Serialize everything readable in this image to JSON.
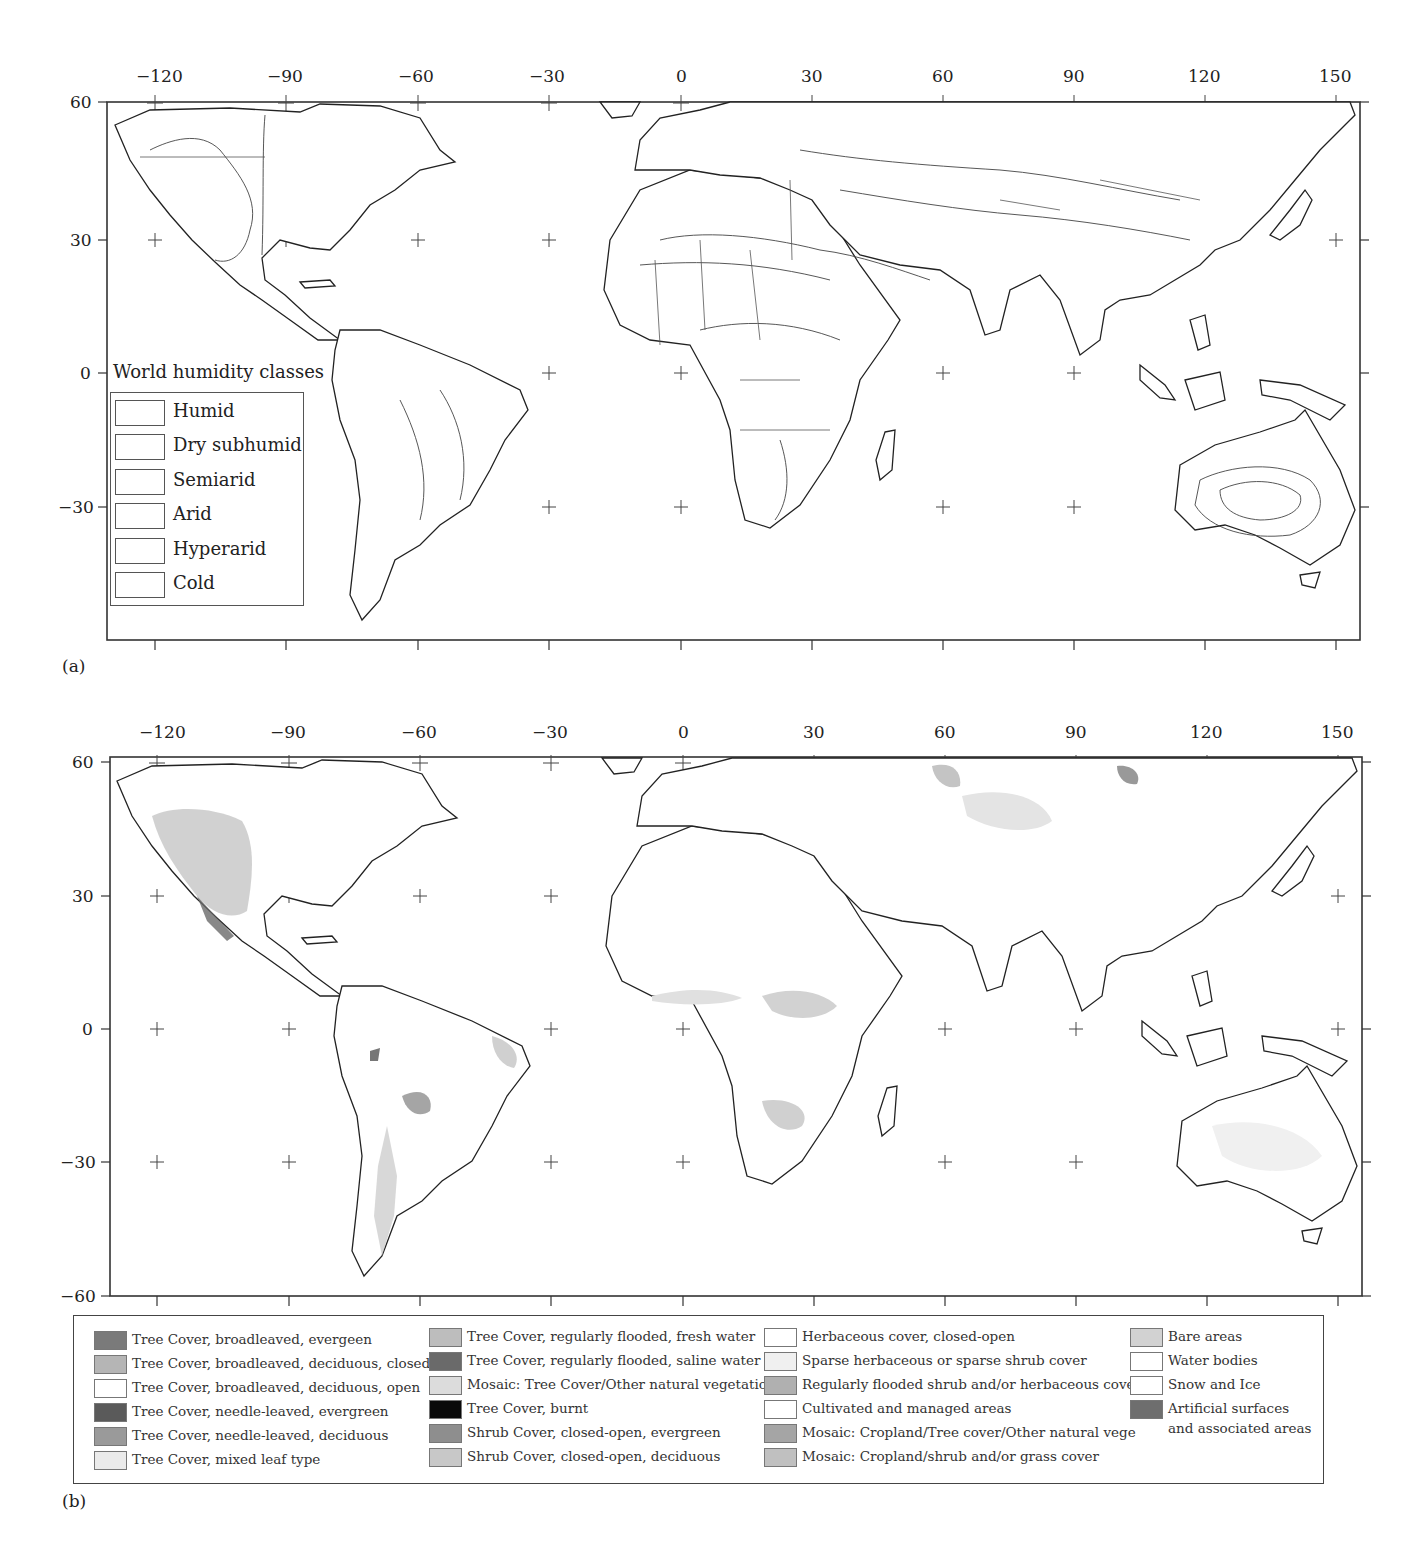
{
  "figure": {
    "panels": [
      {
        "label": "(a)",
        "legend": {
          "title": "World humidity classes",
          "items": [
            "Humid",
            "Dry subhumid",
            "Semiarid",
            "Arid",
            "Hyperarid",
            "Cold"
          ]
        }
      },
      {
        "label": "(b)",
        "legend": {
          "items": [
            {
              "label": "Tree Cover, broadleaved, evergeen",
              "color": "#7a7a7a"
            },
            {
              "label": "Tree Cover, broadleaved, deciduous, closed",
              "color": "#b5b5b5"
            },
            {
              "label": "Tree Cover, broadleaved, deciduous, open",
              "color": "#ffffff"
            },
            {
              "label": "Tree Cover, needle-leaved, evergreen",
              "color": "#5a5a5a"
            },
            {
              "label": "Tree Cover, needle-leaved, deciduous",
              "color": "#9a9a9a"
            },
            {
              "label": "Tree Cover, mixed leaf type",
              "color": "#ebebeb"
            },
            {
              "label": "Tree Cover, regularly flooded, fresh water",
              "color": "#bdbdbd"
            },
            {
              "label": "Tree Cover, regularly flooded, saline water",
              "color": "#6a6a6a"
            },
            {
              "label": "Mosaic: Tree Cover/Other natural vegetation",
              "color": "#dcdcdc"
            },
            {
              "label": "Tree Cover, burnt",
              "color": "#0a0a0a"
            },
            {
              "label": "Shrub Cover, closed-open, evergreen",
              "color": "#8e8e8e"
            },
            {
              "label": "Shrub Cover, closed-open, deciduous",
              "color": "#c8c8c8"
            },
            {
              "label": "Herbaceous cover, closed-open",
              "color": "#ffffff"
            },
            {
              "label": "Sparse herbaceous or sparse shrub cover",
              "color": "#f0f0f0"
            },
            {
              "label": "Regularly flooded shrub and/or herbaceous cover",
              "color": "#b0b0b0"
            },
            {
              "label": "Cultivated and managed areas",
              "color": "#ffffff"
            },
            {
              "label": "Mosaic: Cropland/Tree cover/Other natural vege",
              "color": "#a5a5a5"
            },
            {
              "label": "Mosaic: Cropland/shrub and/or grass cover",
              "color": "#c0c0c0"
            },
            {
              "label": "Bare areas",
              "color": "#d2d2d2"
            },
            {
              "label": "Water bodies",
              "color": "#ffffff"
            },
            {
              "label": "Snow and Ice",
              "color": "#ffffff"
            },
            {
              "label": "Artificial surfaces and associated areas",
              "color": "#6e6e6e"
            }
          ]
        }
      }
    ],
    "axes": {
      "longitude_ticks": [
        "−120",
        "−90",
        "−60",
        "−30",
        "0",
        "30",
        "60",
        "90",
        "120",
        "150"
      ],
      "latitude_ticks_a": [
        "60",
        "30",
        "0",
        "−30"
      ],
      "latitude_ticks_b": [
        "60",
        "30",
        "0",
        "−30",
        "−60"
      ]
    }
  }
}
